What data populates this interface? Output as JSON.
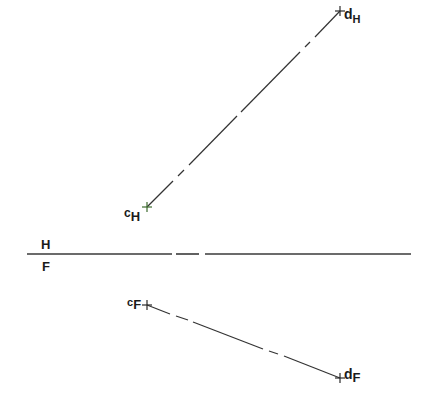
{
  "diagram": {
    "type": "orthographic-projection",
    "folding_line": {
      "label_above": "H",
      "label_below": "F",
      "y": 254,
      "x1": 27,
      "x2": 411,
      "segments": [
        [
          27,
          172
        ],
        [
          176,
          199
        ],
        [
          205,
          411
        ]
      ]
    },
    "line_H": {
      "start_point": {
        "name": "c",
        "sub": "H",
        "x": 147,
        "y": 207
      },
      "end_point": {
        "name": "d",
        "sub": "H",
        "x": 340,
        "y": 11
      },
      "segments": [
        [
          147,
          207,
          173,
          181
        ],
        [
          178,
          176,
          184,
          170
        ],
        [
          189,
          165,
          237,
          116
        ],
        [
          241,
          112,
          300,
          52
        ],
        [
          305,
          47,
          310,
          42
        ],
        [
          315,
          37,
          340,
          11
        ]
      ]
    },
    "line_F": {
      "start_point": {
        "name": "c",
        "sub": "F",
        "x": 147,
        "y": 305
      },
      "end_point": {
        "name": "d",
        "sub": "F",
        "x": 340,
        "y": 378
      },
      "segments": [
        [
          147,
          305,
          170,
          314
        ],
        [
          176,
          316,
          188,
          320
        ],
        [
          193,
          322,
          263,
          349
        ],
        [
          269,
          351,
          278,
          354
        ],
        [
          284,
          356,
          340,
          378
        ]
      ]
    },
    "colors": {
      "line": "#333333",
      "marker": "#2b2b2b",
      "marker_accent": "#3d6b2e"
    }
  }
}
